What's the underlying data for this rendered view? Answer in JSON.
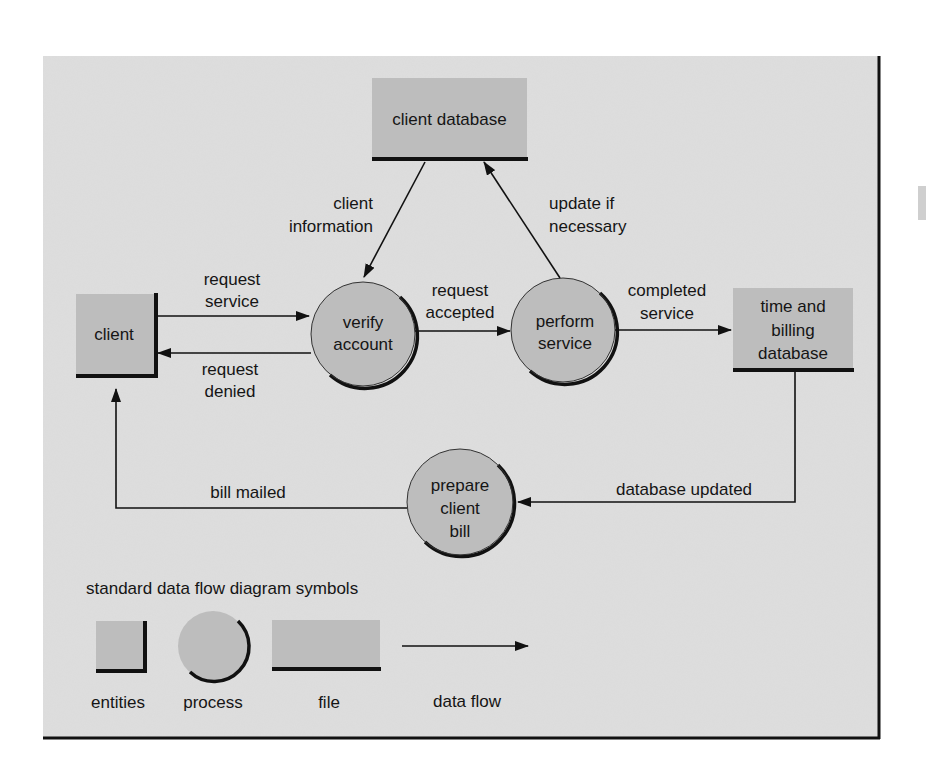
{
  "colors": {
    "panel_bg": "#dedede",
    "shape_fill": "#bdbdbd",
    "stroke": "#111111",
    "page_bg": "#ffffff"
  },
  "nodes": {
    "client_database": {
      "type": "file",
      "label": "client database"
    },
    "client": {
      "type": "entity",
      "label": "client"
    },
    "verify_account": {
      "type": "process",
      "lines": [
        "verify",
        "account"
      ]
    },
    "perform_service": {
      "type": "process",
      "lines": [
        "perform",
        "service"
      ]
    },
    "time_billing": {
      "type": "file",
      "lines": [
        "time and",
        "billing",
        "database"
      ]
    },
    "prepare_bill": {
      "type": "process",
      "lines": [
        "prepare",
        "client",
        "bill"
      ]
    }
  },
  "flows": {
    "client_information": {
      "from": "client database",
      "to": "verify account",
      "lines": [
        "client",
        "information"
      ]
    },
    "update_if_necessary": {
      "from": "perform service",
      "to": "client database",
      "lines": [
        "update if",
        "necessary"
      ]
    },
    "request_service": {
      "from": "client",
      "to": "verify account",
      "lines": [
        "request",
        "service"
      ]
    },
    "request_denied": {
      "from": "verify account",
      "to": "client",
      "lines": [
        "request",
        "denied"
      ]
    },
    "request_accepted": {
      "from": "verify account",
      "to": "perform service",
      "lines": [
        "request",
        "accepted"
      ]
    },
    "completed_service": {
      "from": "perform service",
      "to": "time and billing database",
      "lines": [
        "completed",
        "service"
      ]
    },
    "database_updated": {
      "from": "time and billing database",
      "to": "prepare client bill",
      "label": "database updated"
    },
    "bill_mailed": {
      "from": "prepare client bill",
      "to": "client",
      "label": "bill mailed"
    }
  },
  "legend": {
    "title": "standard data flow diagram symbols",
    "items": [
      {
        "symbol": "entity",
        "label": "entities"
      },
      {
        "symbol": "process",
        "label": "process"
      },
      {
        "symbol": "file",
        "label": "file"
      },
      {
        "symbol": "arrow",
        "label": "data flow"
      }
    ]
  }
}
